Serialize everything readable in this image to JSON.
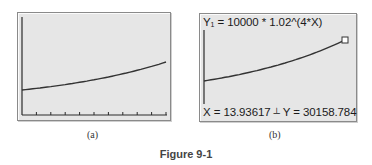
{
  "chart_data": [
    {
      "type": "line",
      "panel": "(a)",
      "title": "",
      "function": "Y1 = 10000 * 1.02^(4*X)",
      "xlabel": "",
      "ylabel": "",
      "x_ticks": 10,
      "grid": false,
      "series": [
        {
          "name": "Y1",
          "x": [
            0,
            2,
            4,
            6,
            8,
            10,
            12,
            14
          ],
          "values": [
            10000,
            11717,
            13728,
            16084,
            18845,
            22080,
            25871,
            30312
          ]
        }
      ]
    },
    {
      "type": "line",
      "panel": "(b)",
      "title": "Y1 = 10000 * 1.02^(4*X)",
      "xlabel": "",
      "ylabel": "",
      "grid": false,
      "series": [
        {
          "name": "Y1",
          "x": [
            0,
            2,
            4,
            6,
            8,
            10,
            12,
            14
          ],
          "values": [
            10000,
            11717,
            13728,
            16084,
            18845,
            22080,
            25871,
            30312
          ]
        }
      ],
      "annotations": [
        {
          "type": "trace-cursor",
          "x": 13.93617,
          "y": 30158.784
        }
      ]
    }
  ],
  "panels": {
    "a": {
      "caption": "(a)"
    },
    "b": {
      "caption": "(b)",
      "equation_prefix": "Y",
      "equation_sub": "1",
      "equation_rest": " = 10000 * 1.02^(4*X)",
      "coord_x": "X = 13.93617",
      "coord_sep": "┴",
      "coord_y": "Y = 30158.784"
    }
  },
  "figure_caption": "Figure 9-1"
}
